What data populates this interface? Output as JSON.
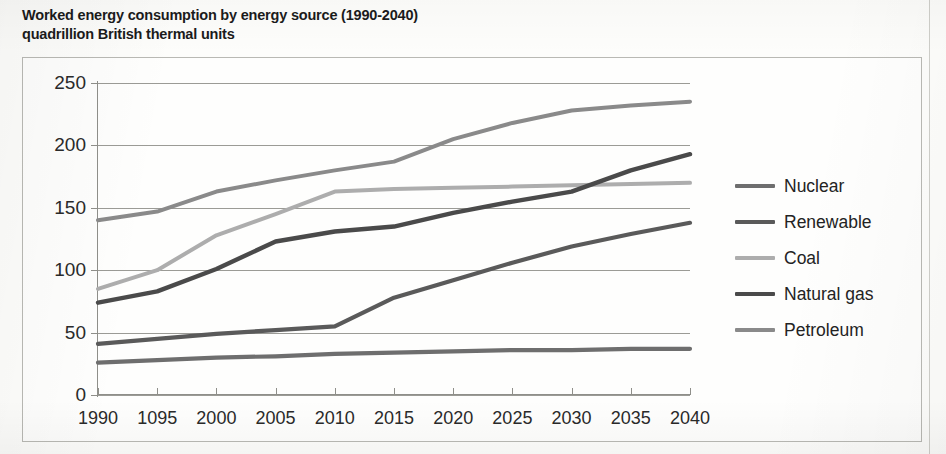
{
  "title": {
    "line1": "Worked energy consumption by energy source (1990-2040)",
    "line2": "quadrillion British thermal units"
  },
  "legend": {
    "position": "right",
    "items": [
      {
        "label": "Nuclear",
        "color": "#6e6e6e"
      },
      {
        "label": "Renewable",
        "color": "#5a5a5a"
      },
      {
        "label": "Coal",
        "color": "#adadad"
      },
      {
        "label": "Natural gas",
        "color": "#4a4a4a"
      },
      {
        "label": "Petroleum",
        "color": "#8a8a8a"
      }
    ]
  },
  "axes": {
    "y_ticks": [
      "0",
      "50",
      "100",
      "150",
      "200",
      "250"
    ],
    "x_ticks": [
      "1990",
      "1095",
      "2000",
      "2005",
      "2010",
      "2015",
      "2020",
      "2025",
      "2030",
      "2035",
      "2040"
    ]
  },
  "chart_data": {
    "type": "line",
    "title": "Worked energy consumption by energy source (1990-2040)",
    "subtitle": "quadrillion British thermal units",
    "xlabel": "",
    "ylabel": "quadrillion British thermal units",
    "categories": [
      "1990",
      "1095",
      "2000",
      "2005",
      "2010",
      "2015",
      "2020",
      "2025",
      "2030",
      "2035",
      "2040"
    ],
    "x": [
      1990,
      1995,
      2000,
      2005,
      2010,
      2015,
      2020,
      2025,
      2030,
      2035,
      2040
    ],
    "ylim": [
      0,
      250
    ],
    "xlim": [
      1990,
      2040
    ],
    "grid": true,
    "legend_position": "right",
    "series": [
      {
        "name": "Petroleum",
        "color": "#8a8a8a",
        "values": [
          140,
          147,
          163,
          172,
          180,
          187,
          205,
          218,
          228,
          232,
          235
        ]
      },
      {
        "name": "Coal",
        "color": "#adadad",
        "values": [
          85,
          100,
          128,
          145,
          163,
          165,
          166,
          167,
          168,
          169,
          170
        ]
      },
      {
        "name": "Natural gas",
        "color": "#4a4a4a",
        "values": [
          74,
          83,
          101,
          123,
          131,
          135,
          146,
          155,
          163,
          180,
          193
        ]
      },
      {
        "name": "Renewable",
        "color": "#5a5a5a",
        "values": [
          41,
          45,
          49,
          52,
          55,
          78,
          92,
          106,
          119,
          129,
          138
        ]
      },
      {
        "name": "Nuclear",
        "color": "#6e6e6e",
        "values": [
          26,
          28,
          30,
          31,
          33,
          34,
          35,
          36,
          36,
          37,
          37
        ]
      }
    ]
  }
}
